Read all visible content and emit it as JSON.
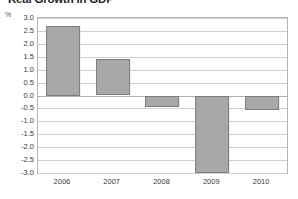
{
  "chart_data": {
    "type": "bar",
    "title": "Real Growth in GDP",
    "xlabel": "",
    "ylabel": "%",
    "unit_label": "%",
    "categories": [
      "2006",
      "2007",
      "2008",
      "2009",
      "2010"
    ],
    "values": [
      2.7,
      1.4,
      -0.45,
      -3.0,
      -0.55
    ],
    "ylim": [
      -3.0,
      3.0
    ],
    "ytick_labels": [
      "3.0",
      "2.5",
      "2.0",
      "1.5",
      "1.0",
      "0.5",
      "0.0",
      "-0.5",
      "-1.0",
      "-1.5",
      "-2.0",
      "-2.5",
      "-3.0"
    ],
    "ytick_values": [
      3.0,
      2.5,
      2.0,
      1.5,
      1.0,
      0.5,
      0.0,
      -0.5,
      -1.0,
      -1.5,
      -2.0,
      -2.5,
      -3.0
    ],
    "grid": true,
    "legend": "none",
    "bar_color": "#a8a8a8",
    "bar_border_color": "#7d7d7d",
    "gridline_color": "#cfcfcf",
    "frame_color": "#b4b4b4",
    "note_2009_clipped": "bar extends to axis floor at -3.0"
  }
}
